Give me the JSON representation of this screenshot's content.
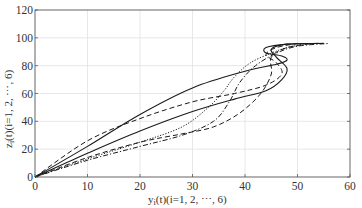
{
  "chart_data": {
    "type": "line",
    "title": "",
    "xlabel": "y_i(t)(i=1, 2, ⋯, 6)",
    "ylabel": "z_i(t)(i=1, 2, ⋯, 6)",
    "xlim": [
      0,
      60
    ],
    "ylim": [
      0,
      120
    ],
    "xticks": [
      0,
      10,
      20,
      30,
      40,
      50,
      60
    ],
    "yticks": [
      0,
      20,
      40,
      60,
      80,
      100,
      120
    ],
    "grid": true,
    "legend": null,
    "series": [
      {
        "name": "agent-1",
        "style": "solid",
        "x": [
          0,
          10,
          20,
          30,
          40,
          46,
          48,
          47,
          44,
          44,
          48,
          55
        ],
        "y": [
          0,
          22,
          45,
          64,
          76,
          81,
          84,
          87,
          89,
          93,
          95.5,
          96
        ]
      },
      {
        "name": "agent-2",
        "style": "solid",
        "x": [
          0,
          10,
          20,
          30,
          38,
          44,
          47,
          48,
          46,
          45,
          48,
          54
        ],
        "y": [
          0,
          17,
          33,
          47,
          56,
          62,
          70,
          78,
          86,
          92,
          95.5,
          96
        ]
      },
      {
        "name": "agent-3",
        "style": "dashed",
        "x": [
          0,
          10,
          20,
          30,
          38,
          44,
          47,
          46,
          44,
          46,
          50
        ],
        "y": [
          0,
          26,
          42,
          54,
          60,
          66,
          74,
          82,
          88,
          93,
          96
        ]
      },
      {
        "name": "agent-4",
        "style": "dashed",
        "x": [
          0,
          10,
          20,
          28,
          34,
          39,
          43,
          45,
          45,
          48,
          53
        ],
        "y": [
          0,
          14,
          25,
          31,
          36,
          46,
          60,
          74,
          86,
          93,
          96
        ]
      },
      {
        "name": "agent-5",
        "style": "dotted",
        "x": [
          0,
          10,
          20,
          28,
          33,
          36,
          38,
          41,
          45,
          48,
          52
        ],
        "y": [
          0,
          13,
          25,
          36,
          50,
          62,
          72,
          82,
          89,
          93,
          96
        ]
      },
      {
        "name": "agent-6",
        "style": "dashdot",
        "x": [
          0,
          10,
          20,
          28,
          34,
          37,
          39,
          42,
          46,
          50,
          56
        ],
        "y": [
          0,
          12,
          22,
          30,
          40,
          54,
          68,
          80,
          89,
          94,
          96
        ]
      }
    ]
  },
  "axes": {
    "x_tick_labels": [
      "0",
      "10",
      "20",
      "30",
      "40",
      "50",
      "60"
    ],
    "y_tick_labels": [
      "0",
      "20",
      "40",
      "60",
      "80",
      "100",
      "120"
    ],
    "xlabel_prefix": "y",
    "xlabel_sub": "i",
    "xlabel_rest": "(t)(i=1, 2, ⋯, 6)",
    "ylabel_prefix": "z",
    "ylabel_sub": "i",
    "ylabel_rest": "(t)(i=1, 2, ⋯, 6)"
  }
}
